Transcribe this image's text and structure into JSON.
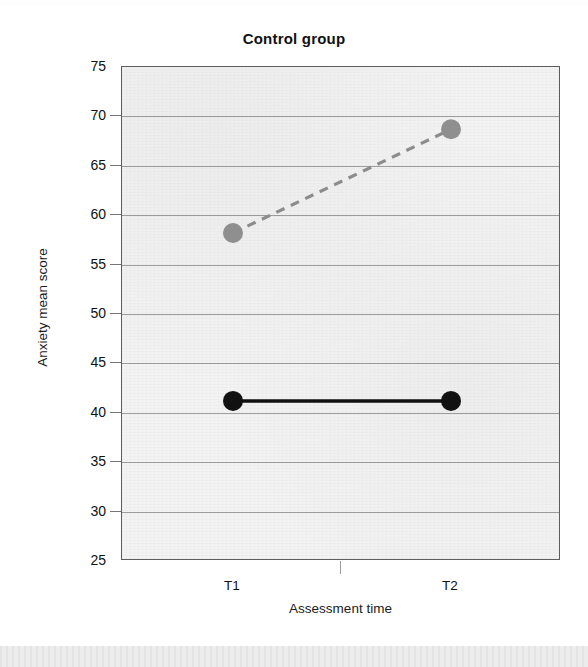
{
  "chart_data": {
    "type": "line",
    "title": "Control group",
    "xlabel": "Assessment time",
    "ylabel": "Anxiety mean score",
    "categories": [
      "T1",
      "T2"
    ],
    "ylim": [
      25,
      75
    ],
    "yticks": [
      25,
      30,
      35,
      40,
      45,
      50,
      55,
      60,
      65,
      70,
      75
    ],
    "ytick_labels": [
      "25",
      "30",
      "35",
      "40",
      "45",
      "50",
      "55",
      "60",
      "65",
      "70",
      "75"
    ],
    "grid": true,
    "legend": "none",
    "series": [
      {
        "name": "dashed-gray-series",
        "values": [
          58.2,
          68.7
        ],
        "line_style": "dashed",
        "color": "#8c8c8c",
        "marker": "circle",
        "marker_color": "#8f8f8f"
      },
      {
        "name": "solid-black-series",
        "values": [
          41.2,
          41.2
        ],
        "line_style": "solid",
        "color": "#111111",
        "marker": "circle",
        "marker_color": "#111111"
      }
    ]
  },
  "figure": {
    "title": "Control group",
    "x_axis_title": "Assessment time",
    "y_axis_title": "Anxiety mean score",
    "x_tick_labels": [
      "T1",
      "T2"
    ],
    "y_tick_labels": [
      "75",
      "70",
      "65",
      "60",
      "55",
      "50",
      "45",
      "40",
      "35",
      "30",
      "25"
    ],
    "panel_color": "#f3f3f3",
    "frame_color": "#5d5d5d",
    "gridline_color": "#8e8e8e"
  }
}
